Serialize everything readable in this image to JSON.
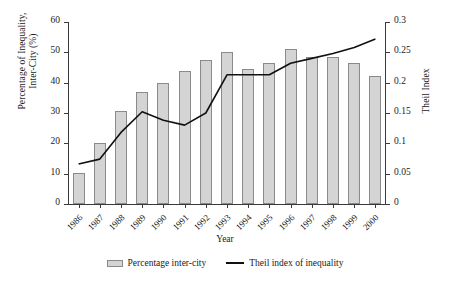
{
  "chart_data": {
    "type": "bar",
    "title": "",
    "xlabel": "Year",
    "ylabel": "Percentage of Inequality,\nInter-City (%)",
    "ylabel_right": "Theil Index",
    "categories": [
      "1986",
      "1987",
      "1988",
      "1989",
      "1990",
      "1991",
      "1992",
      "1993",
      "1994",
      "1995",
      "1996",
      "1997",
      "1998",
      "1999",
      "2000"
    ],
    "ylim": [
      0,
      60
    ],
    "yticks": [
      "0",
      "10",
      "20",
      "30",
      "40",
      "50",
      "60"
    ],
    "ylim_right": [
      0,
      0.3
    ],
    "yticks_right": [
      "0",
      "0.05",
      "0.1",
      "0.15",
      "0.2",
      "0.25",
      "0.3"
    ],
    "grid": false,
    "legend_position": "bottom",
    "series": [
      {
        "name": "Percentage inter-city",
        "type": "bar",
        "axis": "left",
        "color": "#d4d4d4",
        "edge_color": "#8a8a8a",
        "values": [
          10.3,
          20.2,
          30.5,
          37.0,
          40.0,
          44.0,
          47.5,
          50.0,
          44.5,
          46.5,
          51.0,
          48.5,
          48.5,
          46.5,
          42.3
        ]
      },
      {
        "name": "Theil index of inequality",
        "type": "line",
        "axis": "right",
        "color": "#111111",
        "values": [
          0.066,
          0.074,
          0.118,
          0.152,
          0.138,
          0.13,
          0.15,
          0.213,
          0.213,
          0.213,
          0.232,
          0.24,
          0.248,
          0.258,
          0.272
        ]
      }
    ]
  },
  "legend": {
    "bar_label": "Percentage inter-city",
    "line_label": "Theil index of inequality"
  }
}
